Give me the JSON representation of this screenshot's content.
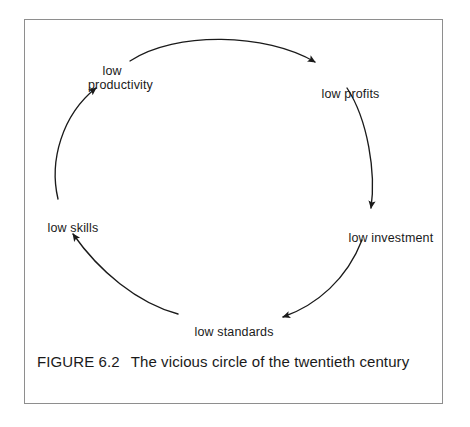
{
  "figure": {
    "frame_color": "#8e8e8e",
    "background": "#ffffff",
    "stroke_color": "#1a1a1a",
    "caption_label": "FIGURE 6.2",
    "caption_text": "The vicious circle of the twentieth century"
  },
  "diagram": {
    "type": "cycle",
    "title": "The vicious circle of the twentieth century",
    "direction": "clockwise",
    "nodes": [
      {
        "id": "low-productivity",
        "label": "low\nproductivity",
        "position": "top-left"
      },
      {
        "id": "low-profits",
        "label": "low profits",
        "position": "top-right"
      },
      {
        "id": "low-investment",
        "label": "low investment",
        "position": "right"
      },
      {
        "id": "low-standards",
        "label": "low standards",
        "position": "bottom"
      },
      {
        "id": "low-skills",
        "label": "low skills",
        "position": "left"
      }
    ],
    "edges": [
      {
        "from": "low-productivity",
        "to": "low-profits",
        "style": "curved-arrow"
      },
      {
        "from": "low-profits",
        "to": "low-investment",
        "style": "curved-arrow"
      },
      {
        "from": "low-investment",
        "to": "low-standards",
        "style": "curved-arrow"
      },
      {
        "from": "low-standards",
        "to": "low-skills",
        "style": "curved-arrow"
      },
      {
        "from": "low-skills",
        "to": "low-productivity",
        "style": "curved-arrow"
      }
    ]
  }
}
